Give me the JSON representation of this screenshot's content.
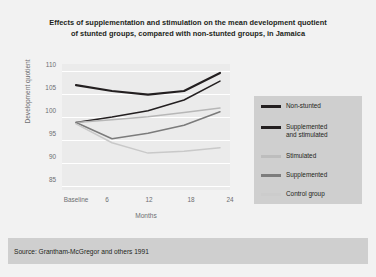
{
  "figure": {
    "title_line1": "Effects of supplementation and stimulation on the mean development quotient",
    "title_line2": "of stunted groups, compared with non-stunted groups, in Jamaica",
    "source": "Source: Grantham-McGregor and others 1991",
    "background_color": "#f2f2f2",
    "plot_background_color": "#ebebeb",
    "panel_color": "#cfcfcf",
    "gridline_color": "#ffffff",
    "text_color": "#231f20",
    "axis_text_color": "#6d6e71"
  },
  "chart_data": {
    "type": "line",
    "title": "Effects of supplementation and stimulation on the mean development quotient of stunted groups, compared with non-stunted groups, in Jamaica",
    "xlabel": "Months",
    "ylabel": "Development quotient",
    "categories": [
      "Baseline",
      "6",
      "12",
      "18",
      "24"
    ],
    "x": [
      0,
      6,
      12,
      18,
      24
    ],
    "xtick_labels": [
      "Baseline",
      "6",
      "12",
      "18",
      "24"
    ],
    "ytick_labels": [
      "85",
      "90",
      "95",
      "100",
      "105",
      "110"
    ],
    "yticks": [
      85,
      90,
      95,
      100,
      105,
      110
    ],
    "ylim": [
      83,
      111
    ],
    "grid": true,
    "grid_axis": "y",
    "legend_position": "right",
    "series": [
      {
        "name": "Non-stunted",
        "color": "#231f20",
        "width": 2.2,
        "values": [
          106.3,
          105.0,
          104.2,
          105.0,
          109.0
        ]
      },
      {
        "name": "Supplemented\nand stimulated",
        "label_display": "Supplemented and stimulated",
        "color": "#231f20",
        "width": 1.5,
        "values": [
          98.0,
          99.2,
          100.6,
          103.0,
          107.2
        ]
      },
      {
        "name": "Stimulated",
        "color": "#b7b7b7",
        "width": 1.5,
        "values": [
          98.0,
          98.6,
          99.3,
          100.2,
          101.2
        ]
      },
      {
        "name": "Supplemented",
        "color": "#7b7b7b",
        "width": 1.5,
        "values": [
          98.0,
          94.4,
          95.6,
          97.4,
          100.4
        ]
      },
      {
        "name": "Control group",
        "color": "#c9c9c9",
        "width": 1.5,
        "values": [
          97.7,
          93.5,
          91.2,
          91.6,
          92.4
        ]
      }
    ]
  },
  "legend": {
    "items": [
      {
        "label": "Non-stunted",
        "color": "#231f20",
        "thickness": 3.4
      },
      {
        "label": "Supplemented\nand stimulated",
        "color": "#231f20",
        "thickness": 3.0
      },
      {
        "label": "Stimulated",
        "color": "#bdbdbd",
        "thickness": 2.8
      },
      {
        "label": "Supplemented",
        "color": "#7d7d7d",
        "thickness": 2.8
      },
      {
        "label": "Control group",
        "color": "#cccccc",
        "thickness": 2.8
      }
    ]
  }
}
